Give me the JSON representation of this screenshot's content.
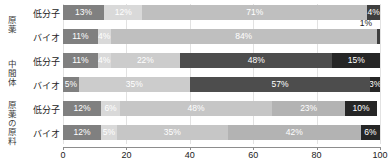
{
  "chart_data": {
    "type": "bar",
    "orientation": "horizontal",
    "stacked": true,
    "normalized_percent": true,
    "title": "",
    "xlabel": "",
    "ylabel": "",
    "xlim": [
      0,
      100
    ],
    "xticks": [
      0,
      20,
      40,
      60,
      80,
      100
    ],
    "xtick_labels": [
      "0",
      "20",
      "40",
      "60",
      "80",
      "100"
    ],
    "grid": true,
    "legend": "none",
    "groups": [
      {
        "name": "原薬",
        "rows": [
          {
            "label": "低分子",
            "segments": [
              {
                "value": 13,
                "label": "13%",
                "color": "#808080",
                "text_color": "#ffffff",
                "label_position": "inside"
              },
              {
                "value": 12,
                "label": "12%",
                "color": "#d9d9d9",
                "text_color": "#ffffff",
                "label_position": "inside"
              },
              {
                "value": 71,
                "label": "71%",
                "color": "#bfbfbf",
                "text_color": "#ffffff",
                "label_position": "inside"
              },
              {
                "value": 4,
                "label": "4%",
                "color": "#3f3f3f",
                "text_color": "#ffffff",
                "label_position": "inside"
              }
            ]
          },
          {
            "label": "バイオ",
            "segments": [
              {
                "value": 11,
                "label": "11%",
                "color": "#808080",
                "text_color": "#ffffff",
                "label_position": "inside"
              },
              {
                "value": 4,
                "label": "4%",
                "color": "#d9d9d9",
                "text_color": "#ffffff",
                "label_position": "inside"
              },
              {
                "value": 84,
                "label": "84%",
                "color": "#bfbfbf",
                "text_color": "#ffffff",
                "label_position": "inside"
              },
              {
                "value": 1,
                "label": "1%",
                "color": "#3f3f3f",
                "text_color": "#222222",
                "label_position": "outside-above"
              }
            ]
          }
        ]
      },
      {
        "name": "中間体",
        "rows": [
          {
            "label": "低分子",
            "segments": [
              {
                "value": 11,
                "label": "11%",
                "color": "#808080",
                "text_color": "#ffffff",
                "label_position": "inside"
              },
              {
                "value": 4,
                "label": "4%",
                "color": "#d9d9d9",
                "text_color": "#ffffff",
                "label_position": "inside"
              },
              {
                "value": 22,
                "label": "22%",
                "color": "#cccccc",
                "text_color": "#ffffff",
                "label_position": "inside"
              },
              {
                "value": 48,
                "label": "48%",
                "color": "#4d4d4d",
                "text_color": "#ffffff",
                "label_position": "inside"
              },
              {
                "value": 15,
                "label": "15%",
                "color": "#262626",
                "text_color": "#ffffff",
                "label_position": "inside"
              }
            ]
          },
          {
            "label": "バイオ",
            "segments": [
              {
                "value": 5,
                "label": "5%",
                "color": "#808080",
                "text_color": "#ffffff",
                "label_position": "inside"
              },
              {
                "value": 35,
                "label": "35%",
                "color": "#cccccc",
                "text_color": "#ffffff",
                "label_position": "inside"
              },
              {
                "value": 57,
                "label": "57%",
                "color": "#4d4d4d",
                "text_color": "#ffffff",
                "label_position": "inside"
              },
              {
                "value": 3,
                "label": "3%",
                "color": "#262626",
                "text_color": "#ffffff",
                "label_position": "inside"
              }
            ]
          }
        ]
      },
      {
        "name": "原薬の原料",
        "rows": [
          {
            "label": "低分子",
            "segments": [
              {
                "value": 12,
                "label": "12%",
                "color": "#808080",
                "text_color": "#ffffff",
                "label_position": "inside"
              },
              {
                "value": 6,
                "label": "6%",
                "color": "#d9d9d9",
                "text_color": "#ffffff",
                "label_position": "inside"
              },
              {
                "value": 48,
                "label": "48%",
                "color": "#c6c6c6",
                "text_color": "#ffffff",
                "label_position": "inside"
              },
              {
                "value": 23,
                "label": "23%",
                "color": "#b3b3b3",
                "text_color": "#ffffff",
                "label_position": "inside"
              },
              {
                "value": 10,
                "label": "10%",
                "color": "#262626",
                "text_color": "#ffffff",
                "label_position": "inside"
              }
            ]
          },
          {
            "label": "バイオ",
            "segments": [
              {
                "value": 12,
                "label": "12%",
                "color": "#808080",
                "text_color": "#ffffff",
                "label_position": "inside"
              },
              {
                "value": 5,
                "label": "5%",
                "color": "#d9d9d9",
                "text_color": "#ffffff",
                "label_position": "inside"
              },
              {
                "value": 35,
                "label": "35%",
                "color": "#c6c6c6",
                "text_color": "#ffffff",
                "label_position": "inside"
              },
              {
                "value": 42,
                "label": "42%",
                "color": "#b3b3b3",
                "text_color": "#ffffff",
                "label_position": "inside"
              },
              {
                "value": 6,
                "label": "6%",
                "color": "#262626",
                "text_color": "#ffffff",
                "label_position": "inside"
              }
            ]
          }
        ]
      }
    ]
  }
}
